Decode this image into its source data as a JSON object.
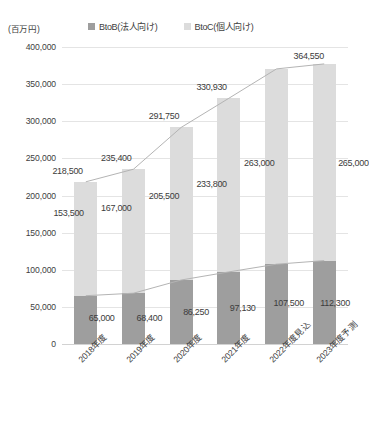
{
  "chart_data": {
    "type": "bar",
    "subtype": "stacked-bar-with-line-overlay",
    "title": "",
    "unit_label": "(百万円)",
    "xlabel": "",
    "ylabel": "",
    "ylim": [
      0,
      400000
    ],
    "ytick_step": 50000,
    "grid": true,
    "legend_position": "top",
    "categories": [
      "2018年度",
      "2019年度",
      "2020年度",
      "2021年度",
      "2022年度見込",
      "2023年度予測"
    ],
    "ytick_labels": [
      "400,000",
      "350,000",
      "300,000",
      "250,000",
      "200,000",
      "150,000",
      "100,000",
      "50,000",
      "0"
    ],
    "ytick_values": [
      400000,
      350000,
      300000,
      250000,
      200000,
      150000,
      100000,
      50000,
      0
    ],
    "series": [
      {
        "name": "BtoB(法人向け)",
        "color": "#9e9e9e",
        "values": [
          65000,
          68400,
          86250,
          97130,
          107500,
          112300
        ],
        "labels": [
          "65,000",
          "68,400",
          "86,250",
          "97,130",
          "107,500",
          "112,300"
        ]
      },
      {
        "name": "BtoC(個人向け)",
        "color": "#dcdcdc",
        "values": [
          153500,
          167000,
          205500,
          233800,
          263000,
          265000
        ],
        "labels": [
          "153,500",
          "167,000",
          "205,500",
          "233,800",
          "263,000",
          "265,000"
        ]
      }
    ],
    "totals": {
      "values": [
        218500,
        235400,
        291750,
        330930,
        370500,
        377300
      ],
      "labels": [
        "218,500",
        "235,400",
        "291,750",
        "330,930",
        "364,550",
        ""
      ]
    },
    "total_label_overrides": [
      "218,500",
      "235,400",
      "291,750",
      "330,930",
      "330,930",
      "364,550"
    ]
  },
  "legend": {
    "items": [
      {
        "label": "BtoB(法人向け)",
        "color": "#9e9e9e"
      },
      {
        "label": "BtoC(個人向け)",
        "color": "#dcdcdc"
      }
    ]
  },
  "axis": {
    "unit": "(百万円)"
  }
}
